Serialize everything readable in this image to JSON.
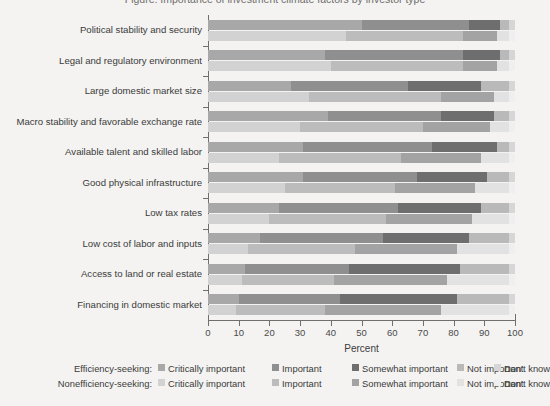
{
  "title": "Figure: Importance of investment climate factors by investor type",
  "axis": {
    "x_title": "Percent",
    "x_ticks": [
      0,
      10,
      20,
      30,
      40,
      50,
      60,
      70,
      80,
      90,
      100
    ],
    "x_min": 0,
    "x_max": 100
  },
  "legend": {
    "row1_label": "Efficiency-seeking:",
    "row2_label": "Nonefficiency-seeking:",
    "items": [
      "Critically important",
      "Important",
      "Somewhat important",
      "Not important",
      "Don't know"
    ]
  },
  "colors": {
    "efficiency": [
      "#a8a8a8",
      "#8f8f8f",
      "#6e6e6e",
      "#b9b9b9",
      "#d6d6d6"
    ],
    "nonefficiency": [
      "#d2d2d2",
      "#bcbcbc",
      "#a3a3a3",
      "#e2e2e2",
      "#efefef"
    ],
    "background": "#f4f3f1",
    "axis": "#6f6f6f",
    "text": "#3b3b3b"
  },
  "chart_data": {
    "type": "bar",
    "orientation": "horizontal",
    "stacked": true,
    "percent_stacked": true,
    "title": "Importance of investment climate factors by investor type",
    "xlabel": "Percent",
    "ylabel": "",
    "xlim": [
      0,
      100
    ],
    "grid": false,
    "legend_position": "bottom",
    "categories": [
      "Political stability and security",
      "Legal and regulatory environment",
      "Large domestic market size",
      "Macro stability and favorable exchange rate",
      "Available talent and skilled labor",
      "Good physical infrastructure",
      "Low tax rates",
      "Low cost of labor and inputs",
      "Access to land or real estate",
      "Financing in domestic market"
    ],
    "segment_labels": [
      "Critically important",
      "Important",
      "Somewhat important",
      "Not important",
      "Don't know"
    ],
    "groups": [
      {
        "name": "Efficiency-seeking",
        "series": [
          {
            "name": "Critically important",
            "values": [
              50,
              38,
              27,
              39,
              31,
              31,
              23,
              17,
              12,
              10
            ]
          },
          {
            "name": "Important",
            "values": [
              35,
              45,
              38,
              37,
              42,
              37,
              39,
              40,
              34,
              33
            ]
          },
          {
            "name": "Somewhat important",
            "values": [
              10,
              12,
              24,
              17,
              21,
              23,
              27,
              28,
              36,
              38
            ]
          },
          {
            "name": "Not important",
            "values": [
              3,
              3,
              9,
              5,
              4,
              7,
              9,
              13,
              16,
              17
            ]
          },
          {
            "name": "Don't know",
            "values": [
              2,
              2,
              2,
              2,
              2,
              2,
              2,
              2,
              2,
              2
            ]
          }
        ]
      },
      {
        "name": "Nonefficiency-seeking",
        "series": [
          {
            "name": "Critically important",
            "values": [
              45,
              40,
              33,
              30,
              23,
              25,
              20,
              13,
              11,
              9
            ]
          },
          {
            "name": "Important",
            "values": [
              38,
              43,
              43,
              40,
              40,
              36,
              38,
              35,
              30,
              29
            ]
          },
          {
            "name": "Somewhat important",
            "values": [
              11,
              11,
              17,
              22,
              26,
              26,
              28,
              33,
              37,
              38
            ]
          },
          {
            "name": "Not important",
            "values": [
              4,
              4,
              5,
              6,
              9,
              11,
              12,
              17,
              20,
              22
            ]
          },
          {
            "name": "Don't know",
            "values": [
              2,
              2,
              2,
              2,
              2,
              2,
              2,
              2,
              2,
              2
            ]
          }
        ]
      }
    ]
  }
}
